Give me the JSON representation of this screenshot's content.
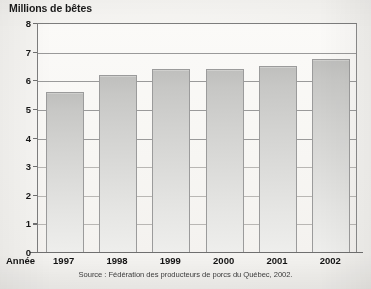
{
  "chart_data": {
    "type": "bar",
    "title": "Millions de bêtes",
    "xlabel": "Année",
    "ylabel": "",
    "categories": [
      "1997",
      "1998",
      "1999",
      "2000",
      "2001",
      "2002"
    ],
    "values": [
      5.6,
      6.2,
      6.4,
      6.4,
      6.5,
      6.75
    ],
    "ylim": [
      0,
      8
    ],
    "yticks": [
      "0",
      "1",
      "2",
      "3",
      "4",
      "5",
      "6",
      "7",
      "8"
    ],
    "ytick_values": [
      0,
      1,
      2,
      3,
      4,
      5,
      6,
      7,
      8
    ],
    "grid": true,
    "legend": false,
    "source": "Source : Fédération des producteurs de porcs du Québec, 2002.",
    "bar_color": "#d2d2d0",
    "bar_border_color": "#9b9b9b",
    "axis_color": "#6f6f6f",
    "grid_color": "#9a9a9a",
    "background_color": "#f4f3f0",
    "text_color": "#131313"
  }
}
